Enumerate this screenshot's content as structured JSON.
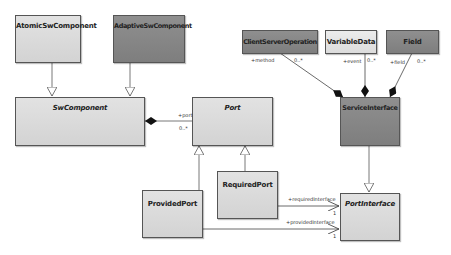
{
  "diagram": {
    "type": "UML class diagram",
    "classes": {
      "atomic": {
        "name": "AtomicSwComponent",
        "abstract": false,
        "fill": "#d8d8d8"
      },
      "adaptive": {
        "name": "AdaptiveSwComponent",
        "abstract": false,
        "fill": "#858585"
      },
      "swcomponent": {
        "name": "SwComponent",
        "abstract": true,
        "fill": "#d8d8d8"
      },
      "port": {
        "name": "Port",
        "abstract": true,
        "fill": "#d8d8d8"
      },
      "provided": {
        "name": "ProvidedPort",
        "abstract": false,
        "fill": "#d8d8d8"
      },
      "required": {
        "name": "RequiredPort",
        "abstract": false,
        "fill": "#d8d8d8"
      },
      "cso": {
        "name": "ClientServerOperation",
        "abstract": false,
        "fill": "#858585"
      },
      "vardata": {
        "name": "VariableData",
        "abstract": false,
        "fill": "#e2e2e2"
      },
      "field": {
        "name": "Field",
        "abstract": false,
        "fill": "#858585"
      },
      "service": {
        "name": "ServiceInterface",
        "abstract": false,
        "fill": "#858585"
      },
      "portinterface": {
        "name": "PortInterface",
        "abstract": true,
        "fill": "#d8d8d8"
      }
    },
    "labels": {
      "port_role": "+port",
      "port_mult": "0..*",
      "method_role": "+method",
      "method_mult": "0..*",
      "event_role": "+event",
      "event_mult": "0..*",
      "field_role": "+field",
      "field_mult": "0..*",
      "required_role": "+requiredInterface",
      "required_mult": "1",
      "provided_role": "+providedInterface",
      "provided_mult": "1"
    },
    "relationships": [
      {
        "type": "generalization",
        "from": "AtomicSwComponent",
        "to": "SwComponent"
      },
      {
        "type": "generalization",
        "from": "AdaptiveSwComponent",
        "to": "SwComponent"
      },
      {
        "type": "composition",
        "whole": "SwComponent",
        "part": "Port",
        "role": "+port",
        "multiplicity": "0..*"
      },
      {
        "type": "generalization",
        "from": "ProvidedPort",
        "to": "Port"
      },
      {
        "type": "generalization",
        "from": "RequiredPort",
        "to": "Port"
      },
      {
        "type": "composition",
        "whole": "ServiceInterface",
        "part": "ClientServerOperation",
        "role": "+method",
        "multiplicity": "0..*"
      },
      {
        "type": "composition",
        "whole": "ServiceInterface",
        "part": "VariableData",
        "role": "+event",
        "multiplicity": "0..*"
      },
      {
        "type": "composition",
        "whole": "ServiceInterface",
        "part": "Field",
        "role": "+field",
        "multiplicity": "0..*"
      },
      {
        "type": "generalization",
        "from": "ServiceInterface",
        "to": "PortInterface"
      },
      {
        "type": "association",
        "from": "RequiredPort",
        "to": "PortInterface",
        "role": "+requiredInterface",
        "multiplicity": "1"
      },
      {
        "type": "association",
        "from": "ProvidedPort",
        "to": "PortInterface",
        "role": "+providedInterface",
        "multiplicity": "1"
      }
    ]
  }
}
